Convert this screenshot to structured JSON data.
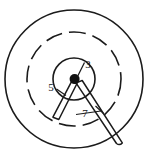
{
  "figure": {
    "title": "",
    "background_color": "#ffffff",
    "line_color": "#1b1b1b",
    "canvas": {
      "width": 154,
      "height": 162
    }
  },
  "geometry": {
    "center": {
      "x": 74,
      "y": 79
    },
    "outer_circle": {
      "name": "outer-solid-circle",
      "radius": 69,
      "style": "solid",
      "stroke_width": 1.6
    },
    "middle_circle": {
      "name": "middle-dashed-circle",
      "radius": 47,
      "style": "dashed",
      "stroke_width": 1.6,
      "dash_pattern": "17 7"
    },
    "inner_circle": {
      "name": "inner-solid-circle",
      "radius": 21,
      "style": "solid",
      "stroke_width": 1.6
    },
    "hub": {
      "name": "center-hub-dot",
      "radius": 5.0,
      "fill": "#111111"
    }
  },
  "arms": [
    {
      "id": "arm-left",
      "label": "5",
      "angle_deg": 243,
      "inner_radius": 4,
      "outer_radius": 49,
      "half_width": 3.0,
      "tip_style": "flat"
    },
    {
      "id": "arm-right",
      "label": "7",
      "angle_deg": 292,
      "inner_radius": 4,
      "outer_radius": 72,
      "half_width": 3.4,
      "tip_style": "rounded"
    }
  ],
  "labels": [
    {
      "id": "label-3",
      "text": "3",
      "x": 86,
      "y": 66,
      "anchor": "middle",
      "size": 11
    },
    {
      "id": "label-5",
      "text": "5",
      "x": 51,
      "y": 89,
      "anchor": "middle",
      "size": 11
    },
    {
      "id": "label-7",
      "text": "7",
      "x": 85,
      "y": 114,
      "anchor": "middle",
      "size": 11
    }
  ],
  "leaders": [
    {
      "id": "leader-3",
      "from": {
        "x": 77,
        "y": 76
      },
      "to": {
        "x": 84,
        "y": 62
      }
    },
    {
      "id": "leader-5",
      "from": {
        "x": 56,
        "y": 90
      },
      "to": {
        "x": 64,
        "y": 94
      }
    },
    {
      "id": "leader-7",
      "from": {
        "x": 74,
        "y": 114
      },
      "to": {
        "x": 100,
        "y": 110
      }
    }
  ],
  "callouts": {
    "three": "3",
    "five": "5",
    "seven": "7"
  }
}
